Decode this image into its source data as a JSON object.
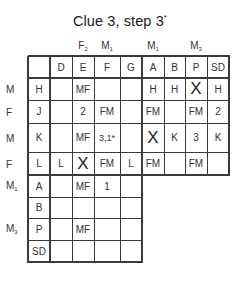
{
  "title": "Clue 3, step 3",
  "title_mark": "*",
  "column_group_labels": [
    {
      "column": "E",
      "letter": "F",
      "sub": "2"
    },
    {
      "column": "F",
      "letter": "M",
      "sub": "1"
    },
    {
      "column": "A",
      "letter": "M",
      "sub": "1"
    },
    {
      "column": "P",
      "letter": "M",
      "sub": "3"
    }
  ],
  "columns": [
    "",
    "D",
    "E",
    "F",
    "G",
    "A",
    "B",
    "P",
    "SD"
  ],
  "row_side_labels": [
    {
      "row": "H",
      "letter": "M",
      "sub": ""
    },
    {
      "row": "J",
      "letter": "F",
      "sub": ""
    },
    {
      "row": "K",
      "letter": "M",
      "sub": ""
    },
    {
      "row": "L",
      "letter": "F",
      "sub": ""
    },
    {
      "row": "A",
      "letter": "M",
      "sub": "1"
    },
    {
      "row": "P",
      "letter": "M",
      "sub": "3"
    }
  ],
  "rows": [
    {
      "head": "H",
      "cells": [
        "",
        "MF",
        "",
        "",
        "H",
        "H",
        "X",
        "H"
      ]
    },
    {
      "head": "J",
      "cells": [
        "",
        "2",
        "FM",
        "",
        "FM",
        "",
        "FM",
        "2"
      ]
    },
    {
      "head": "K",
      "cells": [
        "",
        "MF",
        "3,1*",
        "",
        "X",
        "K",
        "3",
        "K"
      ]
    },
    {
      "head": "L",
      "cells": [
        "L",
        "X",
        "FM",
        "L",
        "FM",
        "",
        "FM",
        ""
      ]
    },
    {
      "head": "A",
      "cells": [
        "",
        "MF",
        "1",
        ""
      ]
    },
    {
      "head": "B",
      "cells": [
        "",
        "",
        "",
        ""
      ]
    },
    {
      "head": "P",
      "cells": [
        "",
        "MF",
        "",
        ""
      ]
    },
    {
      "head": "SD",
      "cells": [
        "",
        "",
        "",
        ""
      ]
    }
  ]
}
